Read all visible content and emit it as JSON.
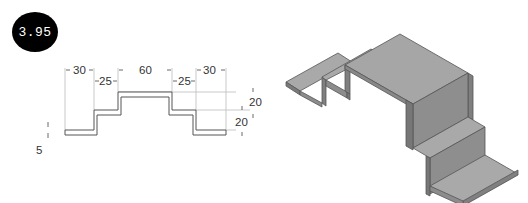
{
  "figure": {
    "number": "3.95"
  },
  "profile_view": {
    "dimensions": {
      "top_left_width": "30",
      "top_center_width": "60",
      "top_right_width": "30",
      "second_left_width": "25",
      "second_right_width": "25",
      "upper_height": "20",
      "lower_height": "20",
      "thickness": "5"
    }
  },
  "isometric_view": {
    "description": "Stepped bent-plate part, isometric view",
    "colors": {
      "top_face": "#a9a9a9",
      "front_face": "#8c8c8c",
      "side_face": "#7a7a7a",
      "edge": "#555555"
    }
  }
}
